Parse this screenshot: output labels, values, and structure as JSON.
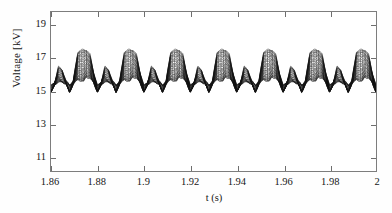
{
  "chart_data": {
    "type": "line",
    "title": "",
    "xlabel": "t (s)",
    "ylabel": "Voltage [kV]",
    "xlim": [
      1.86,
      2.0
    ],
    "ylim": [
      10.1,
      19.8
    ],
    "xticks": [
      1.86,
      1.88,
      1.9,
      1.92,
      1.94,
      1.96,
      1.98,
      2
    ],
    "xticklabels": [
      "1.86",
      "1.88",
      "1.9",
      "1.92",
      "1.94",
      "1.96",
      "1.98",
      "2"
    ],
    "yticks": [
      11,
      13,
      15,
      17,
      19
    ],
    "yticklabels": [
      "11",
      "13",
      "15",
      "17",
      "19"
    ],
    "grid": false,
    "legend": null,
    "series_count": 26,
    "line_color": "#121212",
    "series_note": "Bundle of 26 overlapping voltage waveform traces (Monte-Carlo / multi-node ensemble); all share the same periodic shape with progressively damped amplitude.",
    "period_s": 0.02,
    "cycles_visible": 7,
    "envelope": {
      "plateau_top_max_kv": 17.55,
      "plateau_top_min_kv": 16.0,
      "trough_min_kv": 14.1,
      "trough_max_kv": 15.3,
      "secondary_bump_max_kv": 16.45,
      "secondary_bump_min_kv": 15.6,
      "baseline_kv": 15.45
    },
    "waveform_shape_phase_kv": [
      {
        "phase": 0.0,
        "top": 17.5,
        "bottom": 15.6
      },
      {
        "phase": 0.06,
        "top": 17.5,
        "bottom": 16.3
      },
      {
        "phase": 0.14,
        "top": 17.2,
        "bottom": 16.1
      },
      {
        "phase": 0.22,
        "top": 16.1,
        "bottom": 15.5
      },
      {
        "phase": 0.3,
        "top": 15.3,
        "bottom": 14.15
      },
      {
        "phase": 0.38,
        "top": 15.5,
        "bottom": 15.3
      },
      {
        "phase": 0.46,
        "top": 16.45,
        "bottom": 15.6
      },
      {
        "phase": 0.54,
        "top": 16.3,
        "bottom": 15.55
      },
      {
        "phase": 0.62,
        "top": 15.6,
        "bottom": 15.4
      },
      {
        "phase": 0.7,
        "top": 15.35,
        "bottom": 14.2
      },
      {
        "phase": 0.78,
        "top": 15.6,
        "bottom": 15.35
      },
      {
        "phase": 0.88,
        "top": 17.4,
        "bottom": 15.9
      },
      {
        "phase": 1.0,
        "top": 17.5,
        "bottom": 15.6
      }
    ],
    "series": [
      {
        "name": "trace-1",
        "amplitude_scale": 1.0
      },
      {
        "name": "trace-2",
        "amplitude_scale": 0.96
      },
      {
        "name": "trace-3",
        "amplitude_scale": 0.92
      },
      {
        "name": "trace-4",
        "amplitude_scale": 0.885
      },
      {
        "name": "trace-5",
        "amplitude_scale": 0.85
      },
      {
        "name": "trace-6",
        "amplitude_scale": 0.815
      },
      {
        "name": "trace-7",
        "amplitude_scale": 0.78
      },
      {
        "name": "trace-8",
        "amplitude_scale": 0.745
      },
      {
        "name": "trace-9",
        "amplitude_scale": 0.71
      },
      {
        "name": "trace-10",
        "amplitude_scale": 0.675
      },
      {
        "name": "trace-11",
        "amplitude_scale": 0.64
      },
      {
        "name": "trace-12",
        "amplitude_scale": 0.605
      },
      {
        "name": "trace-13",
        "amplitude_scale": 0.57
      },
      {
        "name": "trace-14",
        "amplitude_scale": 0.535
      },
      {
        "name": "trace-15",
        "amplitude_scale": 0.5
      },
      {
        "name": "trace-16",
        "amplitude_scale": 0.465
      },
      {
        "name": "trace-17",
        "amplitude_scale": 0.43
      },
      {
        "name": "trace-18",
        "amplitude_scale": 0.395
      },
      {
        "name": "trace-19",
        "amplitude_scale": 0.36
      },
      {
        "name": "trace-20",
        "amplitude_scale": 0.325
      },
      {
        "name": "trace-21",
        "amplitude_scale": 0.29
      },
      {
        "name": "trace-22",
        "amplitude_scale": 0.255
      },
      {
        "name": "trace-23",
        "amplitude_scale": 0.22
      },
      {
        "name": "trace-24",
        "amplitude_scale": 0.185
      },
      {
        "name": "trace-25",
        "amplitude_scale": 0.15
      },
      {
        "name": "trace-26",
        "amplitude_scale": 0.115
      }
    ]
  },
  "axes": {
    "frame_color": "#7d7d7d"
  }
}
